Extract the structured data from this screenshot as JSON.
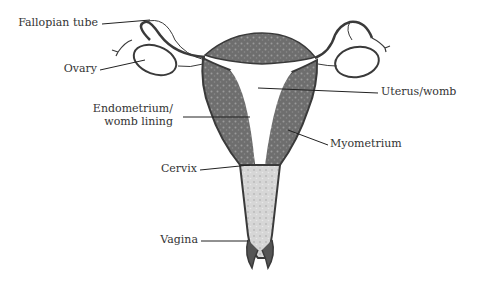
{
  "diagram": {
    "labels": {
      "fallopian_tube": "Fallopian tube",
      "ovary": "Ovary",
      "endometrium_line1": "Endometrium/",
      "endometrium_line2": "womb lining",
      "cervix": "Cervix",
      "vagina": "Vagina",
      "uterus": "Uterus/womb",
      "myometrium": "Myometrium"
    },
    "colors": {
      "myometrium": "#6b6b6b",
      "lining": "#9a9a9a",
      "vagina": "#d4d4d4",
      "outline": "#3a3a3a",
      "text": "#333333"
    }
  }
}
